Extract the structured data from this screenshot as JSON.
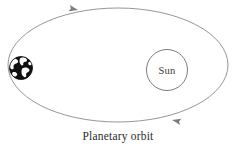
{
  "figure": {
    "caption": "Planetary orbit",
    "background_color": "#ffffff",
    "orbit": {
      "name": "elliptical-orbit-path",
      "stroke_color": "#8a8a8a",
      "stroke_width": 0.9,
      "center_x": 118,
      "center_y": 65,
      "radius_x": 110,
      "radius_y": 57,
      "direction": "counterclockwise"
    },
    "sun": {
      "label": "Sun",
      "center_x": 167,
      "center_y": 70,
      "radius": 20.5,
      "stroke_color": "#6e6e6e",
      "fill_color": "#ffffff"
    },
    "earth": {
      "label": "Earth",
      "center_x": 21,
      "center_y": 68,
      "radius": 11.5,
      "ocean_color": "#111111",
      "land_color": "#ffffff"
    },
    "arrows": [
      {
        "name": "orbit-direction-arrow-top",
        "x": 78,
        "y": 10,
        "rotation": 192,
        "color": "#8a8a8a"
      },
      {
        "name": "orbit-direction-arrow-bottom",
        "x": 172,
        "y": 120,
        "rotation": 12,
        "color": "#8a8a8a"
      }
    ]
  }
}
